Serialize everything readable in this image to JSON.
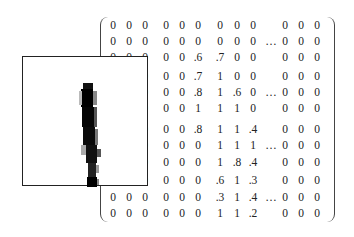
{
  "figure": {
    "digit_label": "1"
  },
  "matrix": {
    "rows": [
      [
        "0",
        "0",
        "0",
        "0",
        "0",
        "0",
        "0",
        "0",
        "0",
        "",
        "0",
        "0",
        "0"
      ],
      [
        "0",
        "0",
        "0",
        "0",
        "0",
        "0",
        "0",
        "0",
        "0",
        "…",
        "0",
        "0",
        "0"
      ],
      [
        "0",
        "0",
        "0",
        "0",
        "0",
        ".6",
        ".7",
        "0",
        "0",
        "",
        "0",
        "0",
        "0"
      ],
      [
        "0",
        "0",
        "0",
        "0",
        "0",
        ".7",
        "1",
        "0",
        "0",
        "",
        "0",
        "0",
        "0"
      ],
      [
        "0",
        "0",
        "0",
        "0",
        "0",
        ".8",
        "1",
        ".6",
        "0",
        "…",
        "0",
        "0",
        "0"
      ],
      [
        "0",
        "0",
        "0",
        "0",
        "0",
        "1",
        "1",
        "1",
        "0",
        "",
        "0",
        "0",
        "0"
      ],
      [
        "0",
        "0",
        "0",
        "0",
        "0",
        ".8",
        "1",
        "1",
        ".4",
        "",
        "0",
        "0",
        "0"
      ],
      [
        "0",
        "0",
        "0",
        "0",
        "0",
        "0",
        "1",
        "1",
        "1",
        "…",
        "0",
        "0",
        "0"
      ],
      [
        "0",
        "0",
        "0",
        "0",
        "0",
        "0",
        "1",
        ".8",
        ".4",
        "",
        "0",
        "0",
        "0"
      ],
      [
        "0",
        "0",
        "0",
        "0",
        "0",
        "0",
        ".6",
        "1",
        ".3",
        "",
        "0",
        "0",
        "0"
      ],
      [
        "0",
        "0",
        "0",
        "0",
        "0",
        "0",
        ".3",
        "1",
        ".4",
        "…",
        "0",
        "0",
        "0"
      ],
      [
        "0",
        "0",
        "0",
        "0",
        "0",
        "0",
        "1",
        "1",
        ".2",
        "",
        "0",
        "0",
        "0"
      ]
    ],
    "row_y": [
      25,
      41,
      57,
      76,
      92,
      108,
      129,
      145,
      162,
      180,
      197,
      213
    ],
    "col_x": [
      113,
      129,
      145,
      166,
      182,
      198,
      220,
      237,
      253,
      271,
      285,
      301,
      317
    ]
  },
  "digit_pixels": [
    {
      "x": 60,
      "y": 26,
      "w": 10,
      "h": 6,
      "shade": "#111"
    },
    {
      "x": 58,
      "y": 32,
      "w": 12,
      "h": 18,
      "shade": "#000"
    },
    {
      "x": 70,
      "y": 34,
      "w": 4,
      "h": 14,
      "shade": "#888"
    },
    {
      "x": 56,
      "y": 34,
      "w": 3,
      "h": 14,
      "shade": "#bbb"
    },
    {
      "x": 59,
      "y": 50,
      "w": 12,
      "h": 20,
      "shade": "#050505"
    },
    {
      "x": 71,
      "y": 50,
      "w": 3,
      "h": 20,
      "shade": "#555"
    },
    {
      "x": 60,
      "y": 70,
      "w": 12,
      "h": 18,
      "shade": "#0a0a0a"
    },
    {
      "x": 72,
      "y": 72,
      "w": 3,
      "h": 16,
      "shade": "#777"
    },
    {
      "x": 63,
      "y": 88,
      "w": 11,
      "h": 18,
      "shade": "#111"
    },
    {
      "x": 74,
      "y": 92,
      "w": 4,
      "h": 8,
      "shade": "#555"
    },
    {
      "x": 58,
      "y": 88,
      "w": 5,
      "h": 10,
      "shade": "#aaa"
    },
    {
      "x": 65,
      "y": 106,
      "w": 8,
      "h": 14,
      "shade": "#222"
    },
    {
      "x": 73,
      "y": 108,
      "w": 3,
      "h": 8,
      "shade": "#999"
    },
    {
      "x": 64,
      "y": 120,
      "w": 10,
      "h": 10,
      "shade": "#000"
    },
    {
      "x": 74,
      "y": 122,
      "w": 2,
      "h": 6,
      "shade": "#888"
    }
  ]
}
